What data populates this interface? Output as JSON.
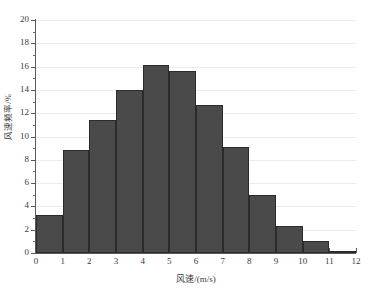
{
  "chart_data": {
    "type": "bar",
    "title": "",
    "xlabel": "风速/(m/s)",
    "ylabel": "风速频率/%",
    "xlim": [
      0,
      12
    ],
    "ylim": [
      0,
      20
    ],
    "grid": true,
    "legend": null,
    "bar_style": "histogram",
    "bin_width": 1,
    "categories": [
      "0-1",
      "1-2",
      "2-3",
      "3-4",
      "4-5",
      "5-6",
      "6-7",
      "7-8",
      "8-9",
      "9-10",
      "10-11",
      "11-12"
    ],
    "bin_starts": [
      0,
      1,
      2,
      3,
      4,
      5,
      6,
      7,
      8,
      9,
      10,
      11
    ],
    "values": [
      3.25,
      8.8,
      11.4,
      14.0,
      16.1,
      15.6,
      12.7,
      9.1,
      5.0,
      2.3,
      1.0,
      0.2
    ],
    "x_ticks": [
      {
        "value": 0,
        "label": "0"
      },
      {
        "value": 1,
        "label": "1"
      },
      {
        "value": 2,
        "label": "2"
      },
      {
        "value": 3,
        "label": "3"
      },
      {
        "value": 4,
        "label": "4"
      },
      {
        "value": 5,
        "label": "5"
      },
      {
        "value": 6,
        "label": "6"
      },
      {
        "value": 7,
        "label": "7"
      },
      {
        "value": 8,
        "label": "8"
      },
      {
        "value": 9,
        "label": "9"
      },
      {
        "value": 10,
        "label": "10"
      },
      {
        "value": 11,
        "label": "11"
      },
      {
        "value": 12,
        "label": "12"
      }
    ],
    "y_ticks": [
      {
        "value": 0,
        "label": "0"
      },
      {
        "value": 2,
        "label": "2"
      },
      {
        "value": 4,
        "label": "4"
      },
      {
        "value": 6,
        "label": "6"
      },
      {
        "value": 8,
        "label": "8"
      },
      {
        "value": 10,
        "label": "10"
      },
      {
        "value": 12,
        "label": "12"
      },
      {
        "value": 14,
        "label": "14"
      },
      {
        "value": 16,
        "label": "16"
      },
      {
        "value": 18,
        "label": "18"
      },
      {
        "value": 20,
        "label": "20"
      }
    ],
    "y_minor_ticks": [
      1,
      3,
      5,
      7,
      9,
      11,
      13,
      15,
      17,
      19
    ],
    "colors": {
      "bar_fill": "#4a4a4a",
      "bar_edge": "#2b2b2b",
      "gridline": "#ececec",
      "axis": "#5a5a5a",
      "text": "#3b3b3b",
      "background": "#ffffff"
    }
  }
}
